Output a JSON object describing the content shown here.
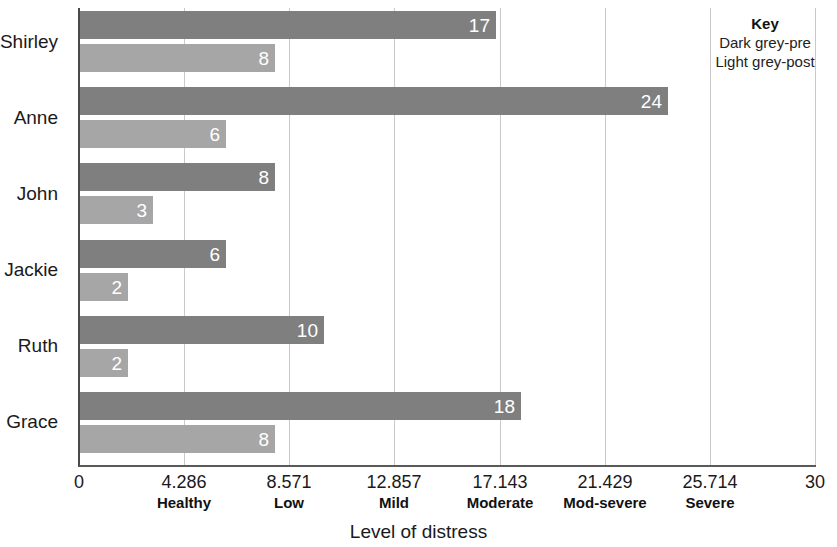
{
  "chart_data": {
    "type": "bar",
    "orientation": "horizontal",
    "title": "",
    "xlabel": "Level of distress",
    "ylabel": "",
    "xlim": [
      0,
      30
    ],
    "grid": true,
    "grid_axis": "x",
    "categories": [
      "Shirley",
      "Anne",
      "John",
      "Jackie",
      "Ruth",
      "Grace"
    ],
    "series": [
      {
        "name": "Dark grey-pre",
        "key": "pre",
        "color": "#7f7f7f",
        "values": [
          17,
          24,
          8,
          6,
          10,
          18
        ]
      },
      {
        "name": "Light grey-post",
        "key": "post",
        "color": "#a6a6a6",
        "values": [
          8,
          6,
          3,
          2,
          2,
          8
        ]
      }
    ],
    "xticks": [
      0,
      4.286,
      8.571,
      12.857,
      17.143,
      21.429,
      25.714,
      30
    ],
    "xtick_labels": [
      "0",
      "4.286",
      "8.571",
      "12.857",
      "17.143",
      "21.429",
      "25.714",
      "30"
    ],
    "band_labels": [
      "Healthy",
      "Low",
      "Mild",
      "Moderate",
      "Mod-severe",
      "Severe"
    ],
    "band_label_positions": [
      4.286,
      8.571,
      12.857,
      17.143,
      21.429,
      25.714
    ],
    "legend": {
      "position": "top-right",
      "title": "Key",
      "entries": [
        "Dark grey-pre",
        "Light grey-post"
      ]
    },
    "data_labels": {
      "pre": [
        "17",
        "24",
        "8",
        "6",
        "10",
        "18"
      ],
      "post": [
        "8",
        "6",
        "3",
        "2",
        "2",
        "8"
      ]
    }
  }
}
